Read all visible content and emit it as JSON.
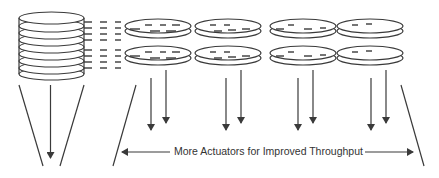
{
  "diagram": {
    "caption": "More Actuators for Improved Throughput",
    "stack": {
      "platters": 9,
      "label": "disk-stack"
    },
    "platter_grid": {
      "rows": 2,
      "columns": 4
    },
    "arrow_groups": 4,
    "colors": {
      "line": "#3a3a3a",
      "text": "#333333",
      "background": "#ffffff"
    }
  }
}
